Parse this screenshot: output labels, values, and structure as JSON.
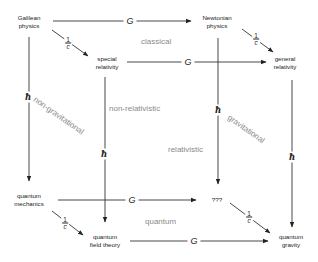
{
  "diagram": {
    "type": "cube-of-physical-theories",
    "nodes": {
      "galilean": {
        "line1": "Galilean",
        "line2": "physics"
      },
      "newtonian": {
        "line1": "Newtonian",
        "line2": "physics"
      },
      "special_relativity": {
        "line1": "special",
        "line2": "relativity"
      },
      "general_relativity": {
        "line1": "general",
        "line2": "relativity"
      },
      "quantum_mechanics": {
        "line1": "quantum",
        "line2": "mechanics"
      },
      "unknown": {
        "line1": "???"
      },
      "quantum_field_theory": {
        "line1": "quantum",
        "line2": "field theory"
      },
      "quantum_gravity": {
        "line1": "quantum",
        "line2": "gravity"
      }
    },
    "edge_labels": {
      "G": "G",
      "hbar": "ħ",
      "one_over_c": {
        "numerator": "1",
        "denominator": "c"
      }
    },
    "regions": {
      "classical": "classical",
      "non_relativistic": "non-relativistic",
      "relativistic": "relativistic",
      "non_gravitational": "non-gravitational",
      "gravitational": "gravitational",
      "quantum": "quantum"
    },
    "colors": {
      "line": "#333333",
      "region_text": "#8a8a8a",
      "text": "#222222"
    }
  }
}
